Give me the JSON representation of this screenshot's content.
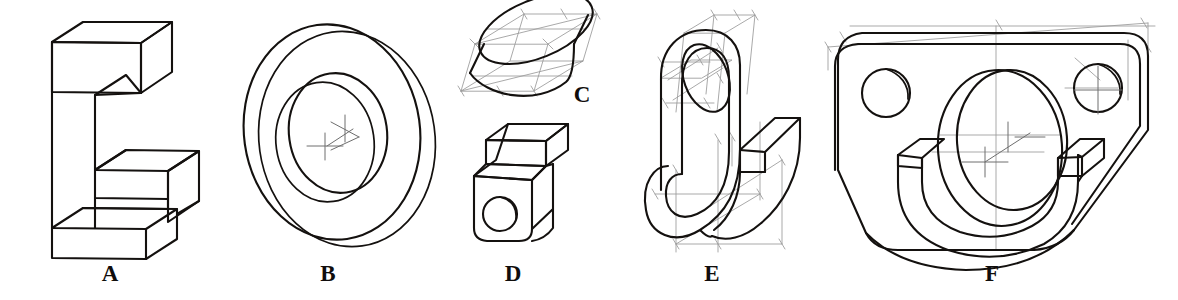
{
  "plate": {
    "title": "Isometric pictorial drawings plate",
    "description": "Six hand-drafted isometric pictorial sketches of machine parts labelled A through F, drawn in black pencil line with light grey construction guide lines and centre-mark crosses on a white background.",
    "background_color": "#ffffff",
    "line_color": "#14110f",
    "construction_line_color": "#9a9a9a",
    "center_mark_color": "#6e6e6e",
    "width": 1178,
    "height": 300
  },
  "figures": [
    {
      "id": "A",
      "label": "A",
      "name": "c-shaped-bracket-block",
      "description": "C-shaped / channel bracket block drawn in isometric with a stepped notch cut from the right side and a projecting bottom foot slab.",
      "label_x": 110,
      "label_y": 265,
      "features": [
        "rectangular notch",
        "bottom foot slab",
        "no construction lines"
      ]
    },
    {
      "id": "B",
      "label": "B",
      "name": "cylindrical-ring-washer",
      "description": "Thick cylindrical ring or washer seen in isometric, showing the outer cylinder ellipse, the rear outer ellipse, the front bore ellipse and the partially visible rear bore ellipse.",
      "label_x": 328,
      "label_y": 265,
      "features": [
        "outer cylinder",
        "through bore",
        "two centre-mark crosses joined by an axis line"
      ]
    },
    {
      "id": "C",
      "label": "C",
      "name": "short-cylinder-disc",
      "description": "Short cylinder (disc) constructed inside a light isometric box, with the top ellipse inscribed in the rhombus and the front cylinder face below it.",
      "label_x": 580,
      "label_y": 86,
      "label_position": "right",
      "features": [
        "isometric construction box",
        "inscribed ellipse",
        "tick marks on guide lines"
      ]
    },
    {
      "id": "D",
      "label": "D",
      "name": "stepped-block-with-hole",
      "description": "Small stepped block in isometric with a rounded lower front face carrying a drilled through hole.",
      "label_x": 513,
      "label_y": 265,
      "features": [
        "step / shoulder",
        "rounded front corners",
        "drilled hole with depth arc"
      ]
    },
    {
      "id": "E",
      "label": "E",
      "name": "j-hook-bracket",
      "description": "J-shaped hook bracket in isometric with an elliptical through hole in the upper eye and a straight tongue projecting to the right, built on light isometric construction boxes.",
      "label_x": 712,
      "label_y": 265,
      "features": [
        "elliptical hole",
        "U-bend",
        "projecting tongue",
        "construction boxes with tick marks"
      ]
    },
    {
      "id": "F",
      "label": "F",
      "name": "bearing-mount-bracket",
      "description": "Bearing mounting bracket in isometric: flanged plate with two counterbored mounting holes and a large central cylindrical boss with bore and a half-round saddle beneath it.",
      "label_x": 992,
      "label_y": 265,
      "features": [
        "two mounting holes",
        "large central bore",
        "saddle / cradle",
        "centre-mark crosses and centrelines"
      ]
    }
  ]
}
